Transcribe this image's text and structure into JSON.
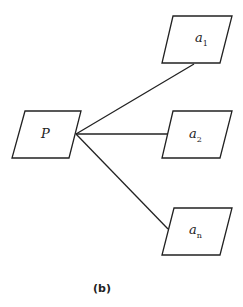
{
  "diagram": {
    "nodes": [
      {
        "id": "P",
        "label": "P",
        "sub": ""
      },
      {
        "id": "a1",
        "label": "a",
        "sub": "1"
      },
      {
        "id": "a2",
        "label": "a",
        "sub": "2"
      },
      {
        "id": "an",
        "label": "a",
        "sub": "n"
      }
    ],
    "edges": [
      {
        "from": "P",
        "to": "a1"
      },
      {
        "from": "P",
        "to": "a2"
      },
      {
        "from": "P",
        "to": "an"
      }
    ],
    "caption": "(b)"
  }
}
